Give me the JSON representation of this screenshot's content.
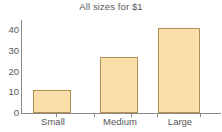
{
  "chart_data": {
    "type": "bar",
    "title": "All sizes for $1",
    "xlabel": "",
    "ylabel": "",
    "categories": [
      "Small",
      "Medium",
      "Large"
    ],
    "values": [
      11,
      27,
      41
    ],
    "ylim": [
      0,
      45
    ],
    "yticks": [
      0,
      10,
      20,
      30,
      40
    ],
    "ytick_labels": [
      "0",
      "10",
      "20",
      "30",
      "40"
    ],
    "grid": false,
    "legend": null,
    "bar_fill_color": "#fadfab",
    "bar_border_color": "#b58e54",
    "axis_color": "#8a8a8a",
    "text_color": "#585858"
  },
  "axis": {
    "tick_0": "0",
    "tick_10": "10",
    "tick_20": "20",
    "tick_30": "30",
    "tick_40": "40"
  },
  "categories": {
    "small": "Small",
    "medium": "Medium",
    "large": "Large"
  }
}
